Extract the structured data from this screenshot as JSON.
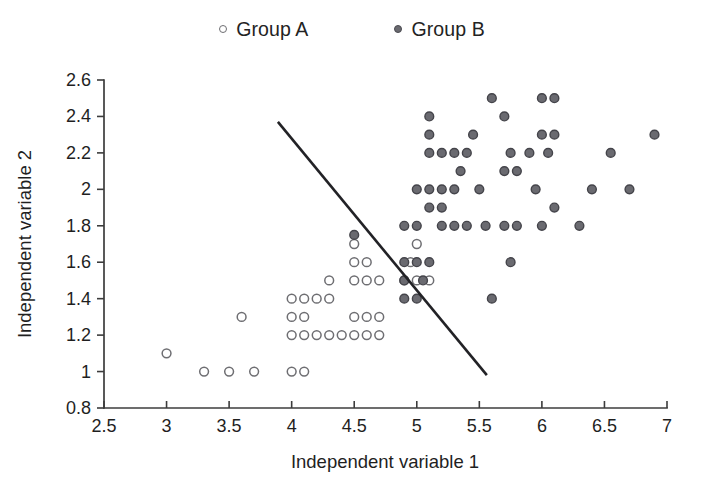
{
  "legend": {
    "position": "top-center",
    "entries": [
      {
        "label": "Group A",
        "marker": "open-circle-marker",
        "color": "#ffffff",
        "edge_color": "#6e6e72"
      },
      {
        "label": "Group B",
        "marker": "filled-circle-marker",
        "color": "#6a6a70",
        "edge_color": "#44444a"
      }
    ]
  },
  "chart_data": {
    "type": "scatter",
    "title": "",
    "xlabel": "Independent variable 1",
    "ylabel": "Independent variable 2",
    "xlim": [
      2.5,
      7.0
    ],
    "ylim": [
      0.8,
      2.6
    ],
    "xticks": [
      "2.5",
      "3",
      "3.5",
      "4",
      "4.5",
      "5",
      "5.5",
      "6",
      "6.5",
      "7"
    ],
    "xtick_values": [
      2.5,
      3,
      3.5,
      4,
      4.5,
      5,
      5.5,
      6,
      6.5,
      7
    ],
    "yticks": [
      "0.8",
      "1",
      "1.2",
      "1.4",
      "1.6",
      "1.8",
      "2",
      "2.2",
      "2.4",
      "2.6"
    ],
    "ytick_values": [
      0.8,
      1.0,
      1.2,
      1.4,
      1.6,
      1.8,
      2.0,
      2.2,
      2.4,
      2.6
    ],
    "grid": false,
    "series": [
      {
        "name": "Group A",
        "marker": "open-circle",
        "color": "#ffffff",
        "edge_color": "#6e6e72",
        "points": [
          [
            3.0,
            1.1
          ],
          [
            3.3,
            1.0
          ],
          [
            3.5,
            1.0
          ],
          [
            3.7,
            1.0
          ],
          [
            3.6,
            1.3
          ],
          [
            4.0,
            1.0
          ],
          [
            4.1,
            1.0
          ],
          [
            4.0,
            1.2
          ],
          [
            4.1,
            1.2
          ],
          [
            4.2,
            1.2
          ],
          [
            4.3,
            1.2
          ],
          [
            4.4,
            1.2
          ],
          [
            4.5,
            1.2
          ],
          [
            4.6,
            1.2
          ],
          [
            4.0,
            1.3
          ],
          [
            4.1,
            1.3
          ],
          [
            4.0,
            1.4
          ],
          [
            4.1,
            1.4
          ],
          [
            4.2,
            1.4
          ],
          [
            4.3,
            1.4
          ],
          [
            4.5,
            1.3
          ],
          [
            4.6,
            1.3
          ],
          [
            4.7,
            1.3
          ],
          [
            4.7,
            1.2
          ],
          [
            4.3,
            1.5
          ],
          [
            4.5,
            1.5
          ],
          [
            4.6,
            1.5
          ],
          [
            4.7,
            1.5
          ],
          [
            4.5,
            1.6
          ],
          [
            4.6,
            1.6
          ],
          [
            4.5,
            1.7
          ],
          [
            5.0,
            1.5
          ],
          [
            5.1,
            1.5
          ],
          [
            5.0,
            1.7
          ],
          [
            4.9,
            1.5
          ],
          [
            4.95,
            1.6
          ]
        ]
      },
      {
        "name": "Group B",
        "marker": "filled-circle",
        "color": "#6a6a70",
        "edge_color": "#44444a",
        "points": [
          [
            4.5,
            1.75
          ],
          [
            4.9,
            1.4
          ],
          [
            5.0,
            1.4
          ],
          [
            4.9,
            1.5
          ],
          [
            5.05,
            1.5
          ],
          [
            4.9,
            1.6
          ],
          [
            5.0,
            1.6
          ],
          [
            5.1,
            1.6
          ],
          [
            4.9,
            1.8
          ],
          [
            5.0,
            1.8
          ],
          [
            5.2,
            1.8
          ],
          [
            5.3,
            1.8
          ],
          [
            5.1,
            1.9
          ],
          [
            5.2,
            1.9
          ],
          [
            5.0,
            2.0
          ],
          [
            5.1,
            2.0
          ],
          [
            5.2,
            2.0
          ],
          [
            5.3,
            2.0
          ],
          [
            5.1,
            2.2
          ],
          [
            5.2,
            2.2
          ],
          [
            5.3,
            2.2
          ],
          [
            5.4,
            2.2
          ],
          [
            5.1,
            2.3
          ],
          [
            5.1,
            2.4
          ],
          [
            5.45,
            2.3
          ],
          [
            5.5,
            2.0
          ],
          [
            5.55,
            1.8
          ],
          [
            5.6,
            2.5
          ],
          [
            5.7,
            2.4
          ],
          [
            5.75,
            2.2
          ],
          [
            5.7,
            2.1
          ],
          [
            5.8,
            2.1
          ],
          [
            5.7,
            1.8
          ],
          [
            5.8,
            1.8
          ],
          [
            5.75,
            1.6
          ],
          [
            5.6,
            1.4
          ],
          [
            5.9,
            2.2
          ],
          [
            5.95,
            2.0
          ],
          [
            6.0,
            2.5
          ],
          [
            6.1,
            2.5
          ],
          [
            6.0,
            2.3
          ],
          [
            6.1,
            2.3
          ],
          [
            6.05,
            2.2
          ],
          [
            6.1,
            1.9
          ],
          [
            6.0,
            1.8
          ],
          [
            6.3,
            1.8
          ],
          [
            6.4,
            2.0
          ],
          [
            6.55,
            2.2
          ],
          [
            6.7,
            2.0
          ],
          [
            6.9,
            2.3
          ],
          [
            5.4,
            1.8
          ],
          [
            5.35,
            2.1
          ]
        ]
      }
    ],
    "annotations": [
      {
        "name": "decision-boundary-line",
        "type": "line",
        "x0": 3.89,
        "y0": 2.37,
        "x1": 5.56,
        "y1": 0.98,
        "color": "#222226"
      }
    ]
  }
}
